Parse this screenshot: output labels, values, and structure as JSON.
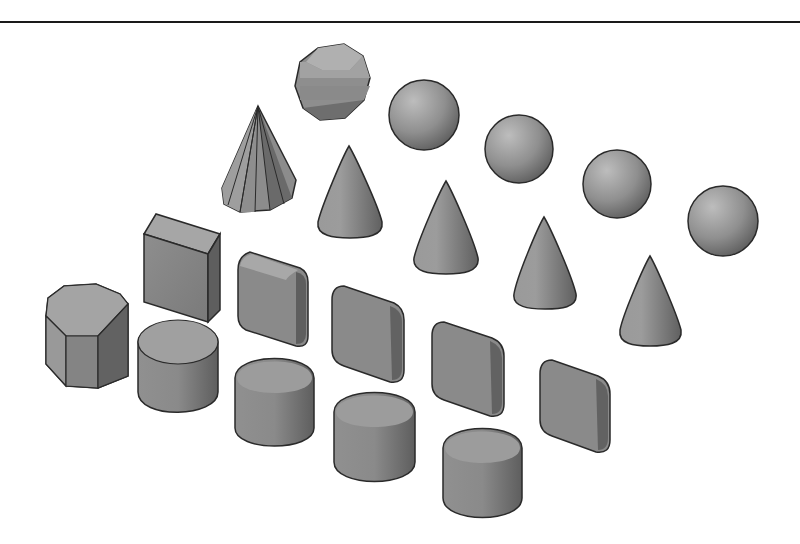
{
  "figure": {
    "rows": [
      {
        "name": "spheres",
        "shapes": [
          "faceted-sphere",
          "sphere",
          "sphere",
          "sphere",
          "sphere"
        ]
      },
      {
        "name": "cones",
        "shapes": [
          "faceted-cone",
          "cone",
          "cone",
          "cone",
          "cone"
        ]
      },
      {
        "name": "boxes",
        "shapes": [
          "box",
          "rounded-box",
          "rounded-box",
          "rounded-box",
          "rounded-box"
        ]
      },
      {
        "name": "cylinders",
        "shapes": [
          "octagonal-prism",
          "cylinder",
          "cylinder",
          "cylinder",
          "cylinder"
        ]
      }
    ]
  },
  "colors": {
    "background": "#ffffff",
    "shape_light": "#b4b4b4",
    "shape_mid": "#8e8e8e",
    "shape_dark": "#5e5e5e",
    "outline": "#2a2a2a",
    "rule": "#1a1a1a"
  }
}
